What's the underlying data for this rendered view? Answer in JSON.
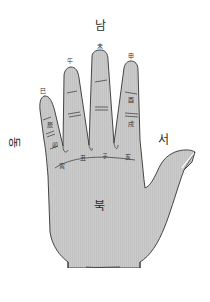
{
  "diagram": {
    "type": "hand-palm-branches",
    "directions": {
      "south": "남",
      "north": "북",
      "east": "동",
      "west": "서"
    },
    "branches": {
      "si": "巳",
      "o": "午",
      "mi": "未",
      "sin": "申",
      "yu": "酉",
      "sul": "戌",
      "hae": "亥",
      "ja": "子",
      "chuk": "丑",
      "in": "寅",
      "myo": "卯",
      "jin": "辰"
    },
    "colors": {
      "hand_fill": "#c8c8c8",
      "outline": "#333333",
      "background": "#ffffff"
    }
  }
}
